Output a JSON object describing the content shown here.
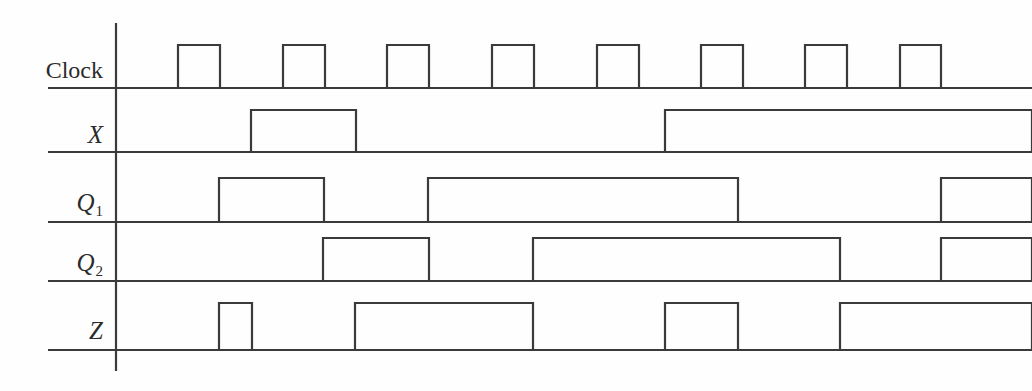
{
  "diagram": {
    "type": "digital-timing-waveform",
    "style": {
      "line_color": "#3a3a3a",
      "background_color": "#fefefe",
      "line_width": 2.2
    },
    "axis": {
      "x": 116,
      "y_top": 23,
      "y_bottom": 371
    },
    "time_axis": {
      "x_start": 116,
      "x_end": 1032,
      "clock_period_px": 104.6,
      "clock_pulse_width_px": 42
    },
    "signals": [
      {
        "name": "Clock",
        "label_base": "Clock",
        "label_sub": "",
        "italic": false,
        "baseline_y": 88,
        "high_y": 45,
        "label_x": 103,
        "label_y": 58,
        "segments": [
          [
            178,
            220
          ],
          [
            283,
            325
          ],
          [
            387,
            429
          ],
          [
            492,
            534
          ],
          [
            597,
            639
          ],
          [
            701,
            743
          ],
          [
            805,
            847
          ],
          [
            900,
            941
          ]
        ],
        "values": "0 1 0 1 0 1 0 1 0 1 0 1 0 1 0 1 0"
      },
      {
        "name": "X",
        "label_base": "X",
        "label_sub": "",
        "italic": true,
        "baseline_y": 152,
        "high_y": 110,
        "label_x": 103,
        "label_y": 122,
        "segments": [
          [
            251,
            356
          ],
          [
            665,
            1032
          ]
        ],
        "values": "0 1 0 0 0 1 1 1"
      },
      {
        "name": "Q1",
        "label_base": "Q",
        "label_sub": "1",
        "italic": true,
        "baseline_y": 222,
        "high_y": 178,
        "label_x": 103,
        "label_y": 190,
        "segments": [
          [
            219,
            324
          ],
          [
            428,
            738
          ],
          [
            941,
            1032
          ]
        ],
        "values": "0 1 0 1 1 1 0 0 1"
      },
      {
        "name": "Q2",
        "label_base": "Q",
        "label_sub": "2",
        "italic": true,
        "baseline_y": 281,
        "high_y": 238,
        "label_x": 103,
        "label_y": 250,
        "segments": [
          [
            323,
            429
          ],
          [
            533,
            840
          ],
          [
            941,
            1032
          ]
        ],
        "values": "0 0 1 0 1 1 1 0 1"
      },
      {
        "name": "Z",
        "label_base": "Z",
        "label_sub": "",
        "italic": true,
        "baseline_y": 350,
        "high_y": 303,
        "label_x": 103,
        "label_y": 318,
        "segments": [
          [
            219,
            252
          ],
          [
            355,
            533
          ],
          [
            665,
            738
          ],
          [
            840,
            1032
          ]
        ],
        "values": "0 1 0 1 1 0 1 0 1"
      }
    ],
    "separators": [
      {
        "name": "separator-clock",
        "y": 88,
        "x1": 48,
        "x2": 1032
      },
      {
        "name": "separator-x",
        "y": 152,
        "x1": 48,
        "x2": 1032
      },
      {
        "name": "separator-q1",
        "y": 222,
        "x1": 48,
        "x2": 1032
      },
      {
        "name": "separator-q2",
        "y": 281,
        "x1": 48,
        "x2": 1032
      },
      {
        "name": "separator-z",
        "y": 350,
        "x1": 48,
        "x2": 1032
      }
    ]
  }
}
